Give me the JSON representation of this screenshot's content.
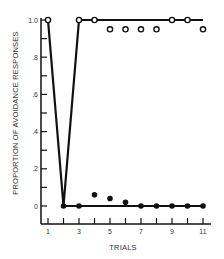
{
  "chart_data": {
    "type": "line",
    "title": "",
    "xlabel": "TRIALS",
    "ylabel": "PROPORTION OF AVOIDANCE RESPONSES",
    "x_tick_labels": [
      "1",
      "3",
      "5",
      "7",
      "9",
      "11"
    ],
    "y_tick_labels": [
      "0",
      ".2",
      ".4",
      ".6",
      ".8",
      "1.0"
    ],
    "xlim": [
      1,
      11
    ],
    "ylim": [
      0,
      1.0
    ],
    "grid": false,
    "legend": null,
    "x": [
      1,
      2,
      3,
      4,
      5,
      6,
      7,
      8,
      9,
      10,
      11
    ],
    "series": [
      {
        "name": "open-circles",
        "marker": "open-circle",
        "values": [
          1.0,
          0,
          1.0,
          1.0,
          0.95,
          0.95,
          0.95,
          0.95,
          1.0,
          1.0,
          0.95
        ]
      },
      {
        "name": "filled-circles",
        "marker": "filled-circle",
        "x": [
          2,
          3,
          4,
          5,
          6,
          7,
          8,
          9,
          10,
          11
        ],
        "values": [
          0,
          0,
          0.06,
          0.04,
          0.02,
          0,
          0,
          0,
          0,
          0
        ]
      },
      {
        "name": "line-upper",
        "marker": "none",
        "x": [
          1,
          2,
          3,
          11
        ],
        "values": [
          1.0,
          0,
          1.0,
          1.0
        ]
      },
      {
        "name": "line-lower",
        "marker": "none",
        "x": [
          2,
          11
        ],
        "values": [
          0,
          0
        ]
      }
    ]
  }
}
